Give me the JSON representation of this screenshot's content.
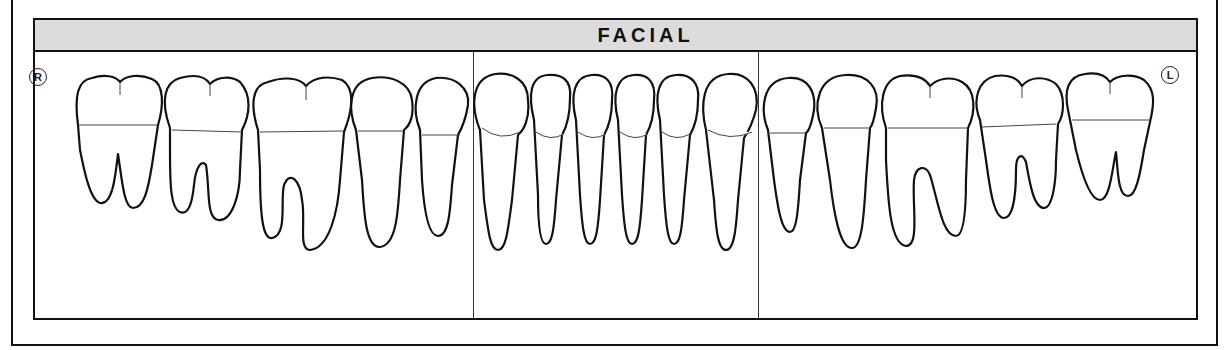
{
  "chart": {
    "title": "FACIAL",
    "side_labels": {
      "right": "R",
      "left": "L"
    },
    "header_color": "#dcdcdc",
    "line_color": "#111111",
    "sections": [
      "right-posterior",
      "anterior",
      "left-posterior"
    ],
    "teeth": [
      {
        "position": 1,
        "type": "molar",
        "roots": 2
      },
      {
        "position": 2,
        "type": "molar",
        "roots": 2
      },
      {
        "position": 3,
        "type": "molar",
        "roots": 2
      },
      {
        "position": 4,
        "type": "premolar",
        "roots": 1
      },
      {
        "position": 5,
        "type": "premolar",
        "roots": 1
      },
      {
        "position": 6,
        "type": "canine",
        "roots": 1
      },
      {
        "position": 7,
        "type": "incisor",
        "roots": 1
      },
      {
        "position": 8,
        "type": "incisor",
        "roots": 1
      },
      {
        "position": 9,
        "type": "incisor",
        "roots": 1
      },
      {
        "position": 10,
        "type": "incisor",
        "roots": 1
      },
      {
        "position": 11,
        "type": "canine",
        "roots": 1
      },
      {
        "position": 12,
        "type": "premolar",
        "roots": 1
      },
      {
        "position": 13,
        "type": "premolar",
        "roots": 1
      },
      {
        "position": 14,
        "type": "molar",
        "roots": 2
      },
      {
        "position": 15,
        "type": "molar",
        "roots": 2
      },
      {
        "position": 16,
        "type": "molar",
        "roots": 2
      }
    ]
  }
}
